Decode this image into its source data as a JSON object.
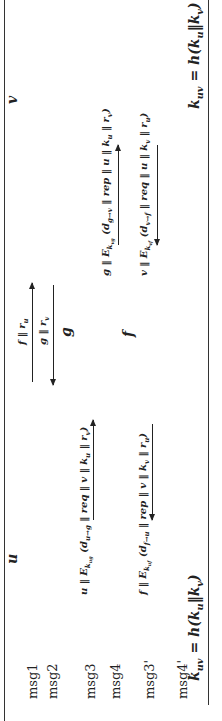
{
  "diagram": {
    "orientation": "rotated 90 degrees counter-clockwise",
    "parties": {
      "left": "u",
      "right": "v",
      "relay_g": "g",
      "relay_f": "f"
    },
    "messages": [
      {
        "id": "msg1",
        "label": "msg1",
        "text": "f‖r_u",
        "from": "u",
        "to": "v"
      },
      {
        "id": "msg2",
        "label": "msg2",
        "text": "g‖r_v",
        "from": "v",
        "to": "u"
      },
      {
        "id": "msg3",
        "label": "msg3",
        "text": "u‖E_k_ug(d_u→g‖req‖v‖k_u‖r_v)",
        "from": "u",
        "to": "g"
      },
      {
        "id": "msg4",
        "label": "msg4",
        "text": "g‖E_k_vg(d_g→v‖rep‖u‖k_u‖r_v)",
        "from": "g",
        "to": "v"
      },
      {
        "id": "msg3p",
        "label": "msg3'",
        "text": "v‖E_k_vf(d_v→f‖req‖u‖k_v‖r_u)",
        "from": "v",
        "to": "f"
      },
      {
        "id": "msg4p",
        "label": "msg4'",
        "text": "f‖E_k_uf(d_f→u‖rep‖v‖k_v‖r_u)",
        "from": "f",
        "to": "u"
      }
    ],
    "session_key_left": "k_uv = h(k_u‖k_v)",
    "session_key_right": "k_uv = h(k_u‖k_v)"
  }
}
